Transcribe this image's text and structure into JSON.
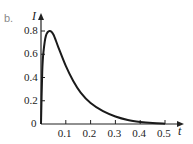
{
  "panel_label": "b.",
  "chart_data": {
    "type": "line",
    "title": "",
    "xlabel": "t",
    "ylabel": "I",
    "xlim": [
      0,
      0.5
    ],
    "ylim": [
      0,
      0.8
    ],
    "x_ticks": [
      "0.1",
      "0.2",
      "0.3",
      "0.4",
      "0.5"
    ],
    "y_ticks": [
      "0",
      "0.2",
      "0.4",
      "0.6",
      "0.8"
    ],
    "grid": false,
    "legend": null,
    "series": [
      {
        "name": "I(t)",
        "x": [
          0,
          0.005,
          0.01,
          0.02,
          0.035,
          0.05,
          0.07,
          0.1,
          0.13,
          0.16,
          0.2,
          0.25,
          0.3,
          0.35,
          0.4,
          0.45,
          0.5
        ],
        "y": [
          0,
          0.45,
          0.62,
          0.76,
          0.8,
          0.77,
          0.66,
          0.5,
          0.37,
          0.27,
          0.18,
          0.11,
          0.065,
          0.035,
          0.018,
          0.008,
          0.003
        ]
      }
    ]
  }
}
